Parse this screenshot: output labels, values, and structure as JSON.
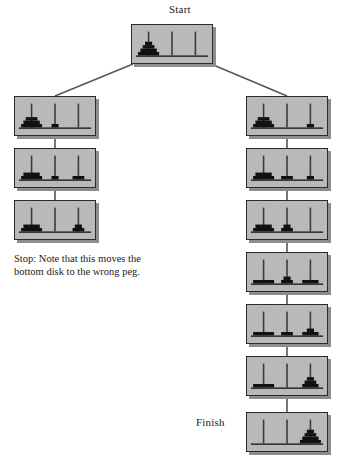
{
  "diagram": {
    "title_start": "Start",
    "title_finish": "Finish",
    "note_text": "Stop: Note that this moves the bottom disk to the wrong peg.",
    "colors": {
      "node_fill": "#b9b9b9",
      "node_border": "#2b2b2b",
      "node_shadow": "#8d8d8d",
      "disk": "#111111",
      "peg": "#3a3a3a",
      "base": "#2b2b2b",
      "edge": "#555555",
      "background": "#ffffff",
      "text": "#1a1a1a"
    },
    "disk_count": 4,
    "peg_count": 3,
    "nodes": [
      {
        "id": "start",
        "name": "start-node",
        "x": 131,
        "y": 24,
        "w": 82,
        "h": 40,
        "pegs": [
          [
            4,
            3,
            2,
            1
          ],
          [],
          []
        ]
      },
      {
        "id": "L1",
        "name": "left-node-1",
        "x": 14,
        "y": 96,
        "w": 82,
        "h": 40,
        "pegs": [
          [
            4,
            3,
            2
          ],
          [
            1
          ],
          []
        ]
      },
      {
        "id": "L2",
        "name": "left-node-2",
        "x": 14,
        "y": 148,
        "w": 82,
        "h": 40,
        "pegs": [
          [
            4,
            3
          ],
          [
            1
          ],
          [
            2
          ]
        ]
      },
      {
        "id": "L3",
        "name": "left-node-3",
        "x": 14,
        "y": 200,
        "w": 82,
        "h": 40,
        "pegs": [
          [
            4,
            3
          ],
          [],
          [
            2,
            1
          ]
        ]
      },
      {
        "id": "R1",
        "name": "right-node-1",
        "x": 246,
        "y": 96,
        "w": 82,
        "h": 40,
        "pegs": [
          [
            4,
            3,
            2
          ],
          [],
          [
            1
          ]
        ]
      },
      {
        "id": "R2",
        "name": "right-node-2",
        "x": 246,
        "y": 148,
        "w": 82,
        "h": 40,
        "pegs": [
          [
            4,
            3
          ],
          [
            2
          ],
          [
            1
          ]
        ]
      },
      {
        "id": "R3",
        "name": "right-node-3",
        "x": 246,
        "y": 200,
        "w": 82,
        "h": 40,
        "pegs": [
          [
            4,
            3
          ],
          [
            2,
            1
          ],
          []
        ]
      },
      {
        "id": "R4",
        "name": "right-node-4",
        "x": 246,
        "y": 252,
        "w": 82,
        "h": 40,
        "pegs": [
          [
            4
          ],
          [
            2,
            1
          ],
          [
            3
          ]
        ]
      },
      {
        "id": "R5",
        "name": "right-node-5",
        "x": 246,
        "y": 304,
        "w": 82,
        "h": 40,
        "pegs": [
          [
            4
          ],
          [
            2
          ],
          [
            3,
            1
          ]
        ]
      },
      {
        "id": "R6",
        "name": "right-node-6",
        "x": 246,
        "y": 356,
        "w": 82,
        "h": 40,
        "pegs": [
          [
            4
          ],
          [],
          [
            3,
            2,
            1
          ]
        ]
      },
      {
        "id": "finish",
        "name": "finish-node",
        "x": 246,
        "y": 412,
        "w": 82,
        "h": 40,
        "pegs": [
          [],
          [],
          [
            4,
            3,
            2,
            1
          ]
        ]
      }
    ],
    "edges": [
      {
        "name": "edge-start-to-left",
        "from": "start",
        "to": "L1",
        "kind": "diagonal-left"
      },
      {
        "name": "edge-start-to-right",
        "from": "start",
        "to": "R1",
        "kind": "diagonal-right"
      },
      {
        "name": "edge-L1-L2",
        "from": "L1",
        "to": "L2",
        "kind": "vertical"
      },
      {
        "name": "edge-L2-L3",
        "from": "L2",
        "to": "L3",
        "kind": "vertical"
      },
      {
        "name": "edge-R1-R2",
        "from": "R1",
        "to": "R2",
        "kind": "vertical"
      },
      {
        "name": "edge-R2-R3",
        "from": "R2",
        "to": "R3",
        "kind": "vertical"
      },
      {
        "name": "edge-R3-R4",
        "from": "R3",
        "to": "R4",
        "kind": "vertical"
      },
      {
        "name": "edge-R4-R5",
        "from": "R4",
        "to": "R5",
        "kind": "vertical"
      },
      {
        "name": "edge-R5-R6",
        "from": "R5",
        "to": "R6",
        "kind": "vertical"
      },
      {
        "name": "edge-R6-finish",
        "from": "R6",
        "to": "finish",
        "kind": "vertical"
      }
    ]
  }
}
